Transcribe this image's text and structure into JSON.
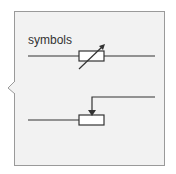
{
  "callout": {
    "label": "symbols",
    "background": "#f2f2f2",
    "border_color": "#9a9a9a"
  },
  "symbols": [
    {
      "name": "variable-resistor"
    },
    {
      "name": "potentiometer"
    }
  ]
}
